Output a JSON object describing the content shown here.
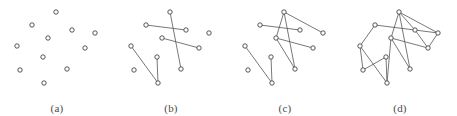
{
  "figure": {
    "background_color": "#ffffff",
    "edge_color": "#555555",
    "node_stroke_color": "#444444",
    "node_fill_color": "#ffffff",
    "caption_color": "#4a4a4a",
    "node_radius": 2.2,
    "panel_count": 4
  },
  "panels": [
    {
      "id": "a",
      "caption": "(a)",
      "description": "Eleven isolated vertices with no edges",
      "node_count": 11,
      "edge_count": 0,
      "nodes": [
        {
          "id": 0,
          "x": 56,
          "y": 12
        },
        {
          "id": 1,
          "x": 32,
          "y": 25
        },
        {
          "id": 2,
          "x": 72,
          "y": 30
        },
        {
          "id": 3,
          "x": 48,
          "y": 38
        },
        {
          "id": 4,
          "x": 17,
          "y": 46
        },
        {
          "id": 5,
          "x": 85,
          "y": 48
        },
        {
          "id": 6,
          "x": 43,
          "y": 57
        },
        {
          "id": 7,
          "x": 67,
          "y": 69
        },
        {
          "id": 8,
          "x": 20,
          "y": 70
        },
        {
          "id": 9,
          "x": 44,
          "y": 83
        },
        {
          "id": 10,
          "x": 95,
          "y": 33
        }
      ],
      "edges": []
    },
    {
      "id": "b",
      "caption": "(b)",
      "description": "Same vertex set with four edges added, forming short disjoint paths",
      "node_count": 11,
      "edge_count": 4,
      "nodes": [
        {
          "id": 0,
          "x": 56,
          "y": 12
        },
        {
          "id": 1,
          "x": 32,
          "y": 25
        },
        {
          "id": 2,
          "x": 72,
          "y": 30
        },
        {
          "id": 3,
          "x": 48,
          "y": 38
        },
        {
          "id": 4,
          "x": 17,
          "y": 46
        },
        {
          "id": 5,
          "x": 85,
          "y": 48
        },
        {
          "id": 6,
          "x": 43,
          "y": 57
        },
        {
          "id": 7,
          "x": 67,
          "y": 69
        },
        {
          "id": 8,
          "x": 20,
          "y": 70
        },
        {
          "id": 9,
          "x": 44,
          "y": 83
        },
        {
          "id": 10,
          "x": 95,
          "y": 33
        }
      ],
      "edges": [
        {
          "from": 1,
          "to": 2
        },
        {
          "from": 0,
          "to": 7
        },
        {
          "from": 3,
          "to": 5
        },
        {
          "from": 4,
          "to": 9
        },
        {
          "from": 6,
          "to": 9
        }
      ]
    },
    {
      "id": "c",
      "caption": "(c)",
      "description": "More edges added, creating a denser cluster in the upper region",
      "node_count": 11,
      "edge_count": 8,
      "nodes": [
        {
          "id": 0,
          "x": 56,
          "y": 12
        },
        {
          "id": 1,
          "x": 32,
          "y": 25
        },
        {
          "id": 2,
          "x": 72,
          "y": 30
        },
        {
          "id": 3,
          "x": 48,
          "y": 38
        },
        {
          "id": 4,
          "x": 17,
          "y": 46
        },
        {
          "id": 5,
          "x": 85,
          "y": 48
        },
        {
          "id": 6,
          "x": 43,
          "y": 57
        },
        {
          "id": 7,
          "x": 67,
          "y": 69
        },
        {
          "id": 8,
          "x": 20,
          "y": 70
        },
        {
          "id": 9,
          "x": 44,
          "y": 83
        },
        {
          "id": 10,
          "x": 95,
          "y": 33
        }
      ],
      "edges": [
        {
          "from": 1,
          "to": 2
        },
        {
          "from": 0,
          "to": 7
        },
        {
          "from": 3,
          "to": 5
        },
        {
          "from": 4,
          "to": 9
        },
        {
          "from": 6,
          "to": 9
        },
        {
          "from": 0,
          "to": 3
        },
        {
          "from": 3,
          "to": 7
        },
        {
          "from": 0,
          "to": 10
        }
      ]
    },
    {
      "id": "d",
      "caption": "(d)",
      "description": "Fully connected graph spanning all vertices with many crossing edges",
      "node_count": 11,
      "edge_count": 15,
      "nodes": [
        {
          "id": 0,
          "x": 56,
          "y": 12
        },
        {
          "id": 1,
          "x": 32,
          "y": 25
        },
        {
          "id": 2,
          "x": 72,
          "y": 30
        },
        {
          "id": 3,
          "x": 48,
          "y": 38
        },
        {
          "id": 4,
          "x": 17,
          "y": 46
        },
        {
          "id": 5,
          "x": 85,
          "y": 48
        },
        {
          "id": 6,
          "x": 43,
          "y": 57
        },
        {
          "id": 7,
          "x": 67,
          "y": 69
        },
        {
          "id": 8,
          "x": 20,
          "y": 70
        },
        {
          "id": 9,
          "x": 44,
          "y": 83
        },
        {
          "id": 10,
          "x": 95,
          "y": 33
        }
      ],
      "edges": [
        {
          "from": 1,
          "to": 2
        },
        {
          "from": 0,
          "to": 7
        },
        {
          "from": 3,
          "to": 5
        },
        {
          "from": 4,
          "to": 9
        },
        {
          "from": 6,
          "to": 9
        },
        {
          "from": 0,
          "to": 3
        },
        {
          "from": 3,
          "to": 7
        },
        {
          "from": 0,
          "to": 10
        },
        {
          "from": 1,
          "to": 4
        },
        {
          "from": 4,
          "to": 8
        },
        {
          "from": 6,
          "to": 8
        },
        {
          "from": 2,
          "to": 10
        },
        {
          "from": 2,
          "to": 5
        },
        {
          "from": 5,
          "to": 10
        },
        {
          "from": 3,
          "to": 9
        },
        {
          "from": 0,
          "to": 2
        }
      ]
    }
  ]
}
